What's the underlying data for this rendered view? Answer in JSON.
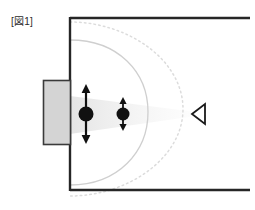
{
  "figure": {
    "caption": "[図1]",
    "caption_plain": "[Fig. 1]",
    "background_color": "#ffffff"
  },
  "diagram": {
    "type": "acoustic-room-cross-section",
    "colors": {
      "wall_line": "#262626",
      "enclosure_fill": "#d4d4d4",
      "enclosure_border": "#3a3a3a",
      "source_fill": "#111111",
      "arrow_color": "#111111",
      "wavefront_solid": "#cfcfcf",
      "wavefront_dotted": "#dcdcdc",
      "beam_fill": "#f0f0f0",
      "listener_stroke": "#1a1a1a"
    },
    "room": {
      "label": "room-boundary",
      "left_wall_x": 70,
      "top_wall_y": 18,
      "bottom_wall_y": 190,
      "top_wall_x_end": 250,
      "bottom_wall_x_end": 250,
      "open_right_side": true,
      "line_width": 2.4
    },
    "enclosure": {
      "label": "speaker-cabinet",
      "x": 43,
      "y": 80,
      "width": 27,
      "height": 64
    },
    "sources": [
      {
        "name": "primary-vibrating-source",
        "cx": 86,
        "cy": 114,
        "r": 7.5,
        "arrow_top_y": 85,
        "arrow_bottom_y": 143,
        "arrow_width": 2.2,
        "head_size": 4.5
      },
      {
        "name": "secondary-vibrating-source",
        "cx": 123,
        "cy": 114,
        "r": 6.5,
        "arrow_top_y": 98,
        "arrow_bottom_y": 130,
        "arrow_width": 1.8,
        "head_size": 3.6
      }
    ],
    "wavefronts": [
      {
        "name": "near-wavefront-solid",
        "style": "solid",
        "apex_x": 148,
        "top_y": 40,
        "bottom_y": 185,
        "wall_x": 70
      },
      {
        "name": "far-wavefront-dotted",
        "style": "dotted",
        "apex_x": 183,
        "top_y": 22,
        "bottom_y": 196,
        "wall_x": 70,
        "dash": "1.6 3.2"
      }
    ],
    "beam": {
      "name": "sound-propagation-beam",
      "origin_x": 70,
      "origin_top_y": 96,
      "origin_bottom_y": 134,
      "tip_x": 196,
      "tip_y": 114
    },
    "listener": {
      "name": "listener-marker",
      "shape": "left-pointing-triangle",
      "tip_x": 192,
      "cx": 205,
      "cy": 114,
      "half_height": 10,
      "stroke_width": 1.8
    }
  }
}
